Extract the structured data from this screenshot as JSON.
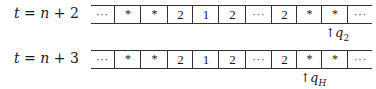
{
  "rows": [
    {
      "label_t": "t",
      "label_eq": " = ",
      "label_n": "n",
      "label_rest": " + 2",
      "cells": [
        "···",
        "*",
        "*",
        "2",
        "1",
        "2",
        "···",
        "2",
        "*",
        "*",
        "···"
      ],
      "head": {
        "arrow": "↑",
        "symbol": "q",
        "subscript": "2",
        "cell_index": 9
      }
    },
    {
      "label_t": "t",
      "label_eq": " = ",
      "label_n": "n",
      "label_rest": " + 3",
      "cells": [
        "···",
        "*",
        "*",
        "2",
        "1",
        "2",
        "···",
        "2",
        "*",
        "*",
        "···"
      ],
      "head": {
        "arrow": "↑",
        "symbol": "q",
        "subscript": "H",
        "cell_index": 8
      }
    }
  ],
  "cell_edges": [
    91,
    114,
    140,
    167,
    192,
    218,
    245,
    271,
    296,
    321,
    347,
    372
  ]
}
